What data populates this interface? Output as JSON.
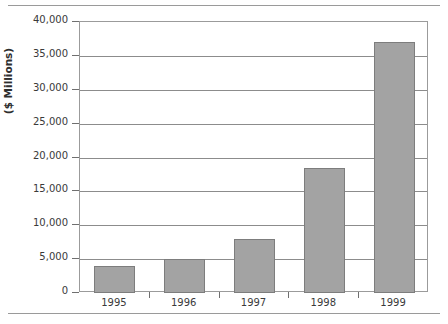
{
  "chart_data": {
    "type": "bar",
    "title": "",
    "subtitle": "",
    "xlabel": "",
    "ylabel": "($ Millions)",
    "categories": [
      "1995",
      "1996",
      "1997",
      "1998",
      "1999"
    ],
    "values": [
      4000,
      5000,
      7900,
      18400,
      37000
    ],
    "series": [
      {
        "name": "",
        "values": [
          4000,
          5000,
          7900,
          18400,
          37000
        ]
      }
    ],
    "ylim": [
      0,
      40000
    ],
    "ytick_values": [
      0,
      5000,
      10000,
      15000,
      20000,
      25000,
      30000,
      35000,
      40000
    ],
    "ytick_labels": [
      "0",
      "5,000",
      "10,000",
      "15,000",
      "20,000",
      "25,000",
      "30,000",
      "35,000",
      "40,000"
    ],
    "grid": "horizontal",
    "legend": "none",
    "bar_fill_color": "#a3a3a3",
    "bar_border_color": "#7d7d7d",
    "gridline_color": "#8c8c8c",
    "axis_color": "#9b9b9b",
    "text_color": "#3a3a3a",
    "background_color": "#ffffff"
  }
}
